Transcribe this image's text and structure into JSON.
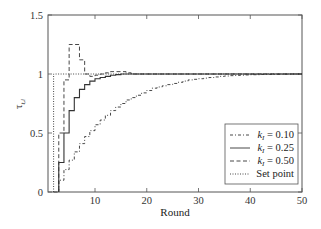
{
  "chart_data": {
    "type": "line",
    "title": "",
    "xlabel": "Round",
    "ylabel": "τ_{t,i}",
    "xlim": [
      1,
      50
    ],
    "ylim": [
      0,
      1.5
    ],
    "xticks": [
      10,
      20,
      30,
      40,
      50
    ],
    "yticks": [
      0,
      0.5,
      1,
      1.5
    ],
    "xtick_labels": [
      "10",
      "20",
      "30",
      "40",
      "50"
    ],
    "ytick_labels": [
      "0",
      "0.5",
      "1",
      "1.5"
    ],
    "grid": false,
    "legend_position": "lower right",
    "step": true,
    "series": [
      {
        "name": "k_I = 0.10",
        "style": "dash-dot",
        "x": [
          3,
          4,
          5,
          6,
          7,
          8,
          9,
          10,
          11,
          12,
          13,
          14,
          15,
          16,
          17,
          18,
          19,
          20,
          21,
          22,
          23,
          24,
          25,
          26,
          27,
          28,
          29,
          30,
          31,
          32,
          33,
          34,
          35,
          36,
          37,
          38,
          39,
          40,
          42,
          44,
          46,
          48,
          50
        ],
        "values": [
          0.1,
          0.19,
          0.27,
          0.34,
          0.41,
          0.47,
          0.52,
          0.57,
          0.61,
          0.65,
          0.69,
          0.72,
          0.75,
          0.78,
          0.8,
          0.82,
          0.84,
          0.86,
          0.88,
          0.89,
          0.9,
          0.91,
          0.92,
          0.93,
          0.94,
          0.95,
          0.955,
          0.96,
          0.965,
          0.97,
          0.975,
          0.98,
          0.983,
          0.986,
          0.988,
          0.99,
          0.992,
          0.994,
          0.996,
          0.998,
          0.999,
          1.0,
          1.0
        ]
      },
      {
        "name": "k_I = 0.25",
        "style": "solid",
        "x": [
          3,
          4,
          5,
          6,
          7,
          8,
          9,
          10,
          11,
          12,
          13,
          14,
          15,
          16,
          18,
          20,
          50
        ],
        "values": [
          0.25,
          0.5,
          0.69,
          0.8,
          0.87,
          0.91,
          0.94,
          0.96,
          0.97,
          0.98,
          0.99,
          0.995,
          1.0,
          1.0,
          1.0,
          1.0,
          1.0
        ]
      },
      {
        "name": "k_I = 0.50",
        "style": "dashed",
        "x": [
          2,
          3,
          4,
          5,
          6,
          7,
          8,
          9,
          10,
          11,
          12,
          13,
          14,
          15,
          16,
          17,
          18,
          50
        ],
        "values": [
          0.0,
          0.5,
          0.95,
          1.25,
          1.25,
          1.12,
          1.0,
          0.98,
          0.99,
          1.0,
          1.01,
          1.02,
          1.02,
          1.02,
          1.01,
          1.0,
          1.0,
          1.0
        ]
      },
      {
        "name": "Set point",
        "style": "dotted",
        "x": [
          2,
          2,
          50
        ],
        "values": [
          0,
          1,
          1
        ]
      }
    ]
  },
  "legend": {
    "items": [
      {
        "label_prefix": "k",
        "label_sub": "I",
        "label_suffix": " = 0.10",
        "style": "dash-dot"
      },
      {
        "label_prefix": "k",
        "label_sub": "I",
        "label_suffix": " = 0.25",
        "style": "solid"
      },
      {
        "label_prefix": "k",
        "label_sub": "I",
        "label_suffix": " = 0.50",
        "style": "dashed"
      },
      {
        "label_prefix": "",
        "label_sub": "",
        "label_suffix": "Set point",
        "style": "dotted"
      }
    ]
  },
  "axes": {
    "xlabel": "Round",
    "ylabel_main": "τ",
    "ylabel_sub": "t,i"
  },
  "colors": {
    "line": "#333333",
    "axis": "#555555",
    "background": "#ffffff"
  }
}
